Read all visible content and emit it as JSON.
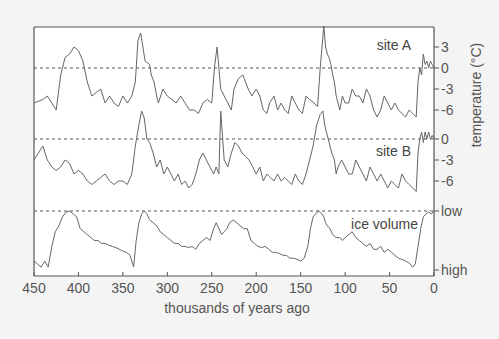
{
  "chart_data": {
    "type": "line",
    "title": "",
    "xlabel": "thousands of years ago",
    "ylabel": "temperature (°C)",
    "xlim": [
      450,
      0
    ],
    "x_ticks": [
      450,
      400,
      350,
      300,
      250,
      200,
      150,
      100,
      50,
      0
    ],
    "grid": false,
    "legend": "inline labels",
    "series": [
      {
        "name": "site A",
        "unit": "°C",
        "y_ticks": [
          3,
          0,
          -3,
          -6
        ],
        "x": [
          450,
          440,
          435,
          430,
          425,
          420,
          415,
          410,
          405,
          400,
          395,
          390,
          385,
          380,
          375,
          370,
          365,
          360,
          355,
          350,
          345,
          340,
          336,
          333,
          330,
          325,
          320,
          318,
          315,
          312,
          310,
          305,
          300,
          295,
          290,
          285,
          280,
          275,
          270,
          265,
          260,
          255,
          250,
          247,
          244,
          240,
          236,
          232,
          228,
          225,
          220,
          215,
          212,
          209,
          205,
          200,
          196,
          192,
          188,
          185,
          180,
          176,
          172,
          168,
          164,
          160,
          156,
          152,
          148,
          144,
          140,
          135,
          131,
          128,
          126,
          124,
          122,
          120,
          118,
          116,
          114,
          112,
          110,
          106,
          103,
          100,
          96,
          92,
          88,
          84,
          80,
          76,
          72,
          68,
          64,
          60,
          56,
          52,
          48,
          44,
          40,
          36,
          32,
          28,
          24,
          20,
          18,
          16,
          14,
          12,
          10,
          8,
          6,
          4,
          2,
          0
        ],
        "values": [
          -5,
          -4.5,
          -4,
          -5,
          -6,
          -1,
          1.5,
          2,
          3,
          2.5,
          1,
          -2,
          -4,
          -3.5,
          -3,
          -5,
          -4,
          -5,
          -5.5,
          -4,
          -5,
          -4,
          -2,
          4,
          5,
          1,
          0.5,
          -1,
          -2,
          -4,
          -5,
          -3,
          -4,
          -4.5,
          -5,
          -4,
          -5,
          -6,
          -6,
          -6.5,
          -5,
          -4.5,
          -5,
          0,
          3,
          -3,
          -4,
          -5,
          -6,
          -3,
          -1.5,
          -1,
          -2,
          -3,
          -4,
          -3,
          -4,
          -6,
          -6.5,
          -5,
          -4,
          -6,
          -5,
          -6,
          -6.5,
          -4,
          -5,
          -6,
          -6.5,
          -4,
          -4.5,
          -5,
          -5.5,
          0,
          3,
          6,
          3,
          2,
          1.5,
          0.5,
          -1,
          -2,
          -4,
          -6,
          -4,
          -5,
          -5,
          -3,
          -4,
          -4,
          -5,
          -3,
          -4,
          -6,
          -7,
          -6,
          -4,
          -5,
          -6,
          -5,
          -6,
          -6.5,
          -7,
          -6,
          -6.5,
          -7,
          -2,
          0,
          -1,
          2,
          0.5,
          1,
          0,
          1,
          0.5,
          0
        ]
      },
      {
        "name": "site B",
        "unit": "°C",
        "y_ticks": [
          0,
          -3,
          -6
        ],
        "x": [
          450,
          445,
          440,
          435,
          430,
          425,
          420,
          415,
          410,
          405,
          400,
          395,
          390,
          385,
          380,
          375,
          370,
          365,
          360,
          355,
          350,
          345,
          340,
          336,
          332,
          329,
          326,
          323,
          320,
          316,
          312,
          308,
          304,
          300,
          296,
          292,
          288,
          284,
          280,
          276,
          272,
          268,
          264,
          260,
          256,
          252,
          248,
          245,
          242,
          240,
          236,
          232,
          228,
          224,
          220,
          216,
          212,
          208,
          204,
          200,
          196,
          192,
          188,
          184,
          180,
          176,
          172,
          168,
          164,
          160,
          156,
          152,
          148,
          144,
          140,
          136,
          132,
          128,
          125,
          123,
          121,
          119,
          117,
          115,
          112,
          110,
          108,
          104,
          100,
          96,
          92,
          88,
          84,
          80,
          76,
          72,
          68,
          64,
          60,
          56,
          52,
          48,
          44,
          40,
          36,
          32,
          28,
          24,
          20,
          18,
          16,
          14,
          12,
          10,
          8,
          6,
          4,
          2,
          0
        ],
        "values": [
          -3,
          -2,
          -1,
          -3,
          -4,
          -4.5,
          -4,
          -3,
          -3.5,
          -5,
          -4.5,
          -5,
          -6,
          -6.5,
          -6,
          -5.5,
          -5,
          -6,
          -6.5,
          -6,
          -6,
          -6.5,
          -5,
          -1,
          2,
          4,
          3,
          0,
          -0.5,
          -2,
          -4,
          -3,
          -5,
          -4,
          -5,
          -6,
          -5,
          -6.5,
          -6,
          -7,
          -6.5,
          -5,
          -3,
          -2,
          -3,
          -4,
          -5,
          -4,
          -5,
          4,
          -3,
          -4,
          -2,
          -0.5,
          -1,
          -2,
          -2.5,
          -3,
          -4,
          -5,
          -4,
          -6,
          -5,
          -5.5,
          -6,
          -5,
          -6,
          -5.5,
          -6,
          -6.5,
          -5,
          -6,
          -6.5,
          -5,
          -3,
          -1,
          2,
          3.5,
          4,
          2,
          1,
          0,
          -1,
          -2,
          -3,
          -5,
          -4,
          -3,
          -4,
          -5,
          -5,
          -3,
          -4,
          -5,
          -6,
          -4,
          -5,
          -6,
          -5,
          -6,
          -7,
          -6,
          -6.5,
          -7,
          -5,
          -6,
          -6.5,
          -7,
          -7.5,
          -2,
          0,
          1,
          -0.5,
          1,
          0,
          1,
          0,
          0.5,
          0
        ]
      },
      {
        "name": "ice volume",
        "unit": "relative (low to high)",
        "y_ticks": [
          "low",
          "high"
        ],
        "x": [
          450,
          446,
          442,
          438,
          434,
          430,
          426,
          422,
          418,
          414,
          410,
          406,
          402,
          398,
          394,
          390,
          386,
          382,
          378,
          374,
          370,
          366,
          362,
          358,
          354,
          350,
          346,
          342,
          338,
          335,
          332,
          329,
          326,
          323,
          320,
          316,
          312,
          308,
          304,
          300,
          296,
          292,
          288,
          284,
          280,
          276,
          272,
          268,
          264,
          260,
          256,
          252,
          248,
          245,
          242,
          239,
          236,
          233,
          230,
          226,
          222,
          218,
          214,
          210,
          206,
          202,
          198,
          194,
          190,
          186,
          182,
          178,
          174,
          170,
          166,
          162,
          158,
          154,
          150,
          146,
          142,
          139,
          136,
          133,
          130,
          128,
          126,
          124,
          122,
          120,
          117,
          114,
          110,
          106,
          103,
          100,
          96,
          92,
          88,
          84,
          80,
          76,
          72,
          68,
          64,
          60,
          56,
          52,
          48,
          44,
          40,
          36,
          32,
          28,
          24,
          21,
          18,
          15,
          12,
          9,
          6,
          3,
          0
        ],
        "values": [
          0.85,
          0.9,
          0.95,
          0.85,
          0.95,
          0.6,
          0.35,
          0.25,
          0.1,
          0.02,
          0,
          0.05,
          0.1,
          0.3,
          0.35,
          0.4,
          0.45,
          0.5,
          0.5,
          0.55,
          0.55,
          0.58,
          0.6,
          0.62,
          0.65,
          0.68,
          0.7,
          0.75,
          0.95,
          0.5,
          0.2,
          0.05,
          0,
          0.05,
          0.15,
          0.2,
          0.25,
          0.35,
          0.4,
          0.45,
          0.5,
          0.55,
          0.55,
          0.6,
          0.6,
          0.62,
          0.6,
          0.65,
          0.55,
          0.5,
          0.45,
          0.5,
          0.3,
          0.2,
          0.3,
          0.4,
          0.35,
          0.3,
          0.2,
          0.15,
          0.2,
          0.25,
          0.3,
          0.3,
          0.5,
          0.55,
          0.6,
          0.62,
          0.6,
          0.65,
          0.7,
          0.7,
          0.72,
          0.75,
          0.75,
          0.8,
          0.8,
          0.82,
          0.85,
          0.8,
          0.6,
          0.3,
          0.1,
          0.05,
          0,
          0.02,
          0.05,
          0.1,
          0.2,
          0.25,
          0.3,
          0.4,
          0.45,
          0.45,
          0.5,
          0.45,
          0.4,
          0.35,
          0.45,
          0.5,
          0.55,
          0.6,
          0.55,
          0.65,
          0.65,
          0.6,
          0.7,
          0.65,
          0.7,
          0.75,
          0.8,
          0.82,
          0.85,
          0.88,
          0.95,
          0.9,
          0.6,
          0.3,
          0.1,
          0.05,
          0.02,
          0.05,
          0
        ]
      }
    ]
  },
  "labels": {
    "site_a": "site A",
    "site_b": "site B",
    "ice": "ice volume",
    "ice_low": "low",
    "ice_high": "high",
    "ylabel": "temperature (°C)",
    "xlabel": "thousands of years ago"
  }
}
